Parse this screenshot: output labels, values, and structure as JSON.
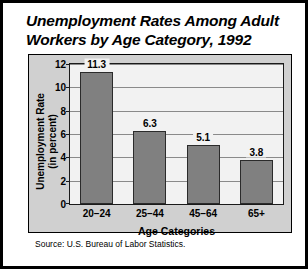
{
  "title": "Unemployment Rates Among Adult Workers by Age Category, 1992",
  "source": "Source: U.S. Bureau of Labor Statistics.",
  "colors": {
    "bar_fill": "#808080",
    "bar_stroke": "#2b2b2b",
    "plot_bg": "#f2f2f2",
    "panel_bg": "#d0d0d0",
    "gridline": "#8a8a8a",
    "page_border": "#000000"
  },
  "chart_data": {
    "type": "bar",
    "title": "Unemployment Rates Among Adult Workers by Age Category, 1992",
    "categories": [
      "20–24",
      "25–44",
      "45–64",
      "65+"
    ],
    "values": [
      11.3,
      6.3,
      5.1,
      3.8
    ],
    "value_labels": [
      "11.3",
      "6.3",
      "5.1",
      "3.8"
    ],
    "xlabel": "Age Categories",
    "ylabel": "Unemployment Rate (in percent)",
    "ylabel_line1": "Unemployment Rate",
    "ylabel_line2": "(in percent)",
    "ylim": [
      0,
      12
    ],
    "yticks": [
      0,
      2,
      4,
      6,
      8,
      10,
      12
    ],
    "ytick_labels": [
      "0",
      "2",
      "4",
      "6",
      "8",
      "10",
      "12"
    ],
    "grid": true,
    "legend": false,
    "source": "Source: U.S. Bureau of Labor Statistics."
  }
}
